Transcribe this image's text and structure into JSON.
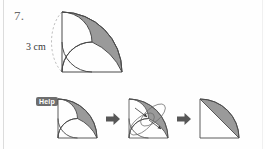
{
  "problem": {
    "number": "7.",
    "dimension_label": "3 cm"
  },
  "help": {
    "badge_label": "Help"
  },
  "figure": {
    "radius_cm": 3,
    "shape_fill": "#9a9a9a",
    "outline_color": "#4a4a4a",
    "dashed_guide_color": "#b4b4b4"
  },
  "steps": [
    {
      "name": "step-1-original",
      "caption": "original shaded lens regions"
    },
    {
      "name": "step-2-rearrange",
      "caption": "rotate and rearrange the pieces"
    },
    {
      "name": "step-3-result",
      "caption": "resulting circular segment"
    }
  ],
  "arrows": [
    {
      "name": "arrow-1",
      "glyph": "right-arrow"
    },
    {
      "name": "arrow-2",
      "glyph": "right-arrow"
    }
  ],
  "colors": {
    "page_background": "#fefefe",
    "shade": "#9a9a9a",
    "stroke": "#4a4a4a",
    "badge_background": "#6e6e6e",
    "badge_text": "#ffffff",
    "arrow": "#575757",
    "rule": "#dcdcdc"
  }
}
